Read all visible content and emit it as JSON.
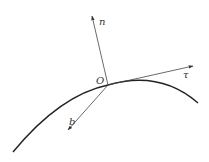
{
  "diagram": {
    "labels": {
      "origin": "O",
      "normal": "n",
      "tangent": "τ",
      "binormal": "b"
    },
    "colors": {
      "curve": "#222222",
      "vectors": "#444444",
      "text": "#333333",
      "background": "#ffffff"
    },
    "geometry": {
      "origin": [
        108,
        85
      ],
      "normal_tip": [
        92,
        16
      ],
      "tangent_tip": [
        193,
        66
      ],
      "binormal_tip": [
        68,
        130
      ],
      "curve_path": "M 13 152 Q 60 95 108 85 Q 160 70 198 103"
    }
  }
}
